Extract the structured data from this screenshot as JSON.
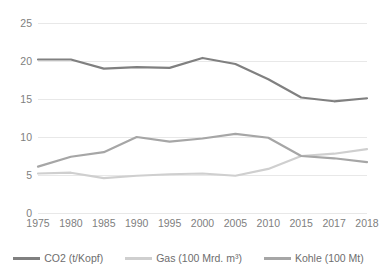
{
  "chart_data": {
    "type": "line",
    "title": "",
    "subtitle": "",
    "xlabel": "",
    "ylabel": "",
    "grid": true,
    "legend_position": "bottom",
    "ylim": [
      0,
      25
    ],
    "yticks": [
      0,
      5,
      10,
      15,
      20,
      25
    ],
    "categories": [
      "1975",
      "1980",
      "1985",
      "1990",
      "1995",
      "2000",
      "2005",
      "2010",
      "2015",
      "2017",
      "2018"
    ],
    "series": [
      {
        "name": "CO2 (t/Kopf)",
        "color": "#808080",
        "values": [
          20.2,
          20.2,
          19.0,
          19.2,
          19.1,
          20.4,
          19.6,
          17.6,
          15.2,
          14.7,
          15.1
        ]
      },
      {
        "name": "Gas (100 Mrd. m³)",
        "color": "#cfcfcf",
        "values": [
          5.2,
          5.3,
          4.6,
          4.9,
          5.1,
          5.2,
          4.9,
          5.8,
          7.5,
          7.8,
          8.4
        ]
      },
      {
        "name": "Kohle (100 Mt)",
        "color": "#a6a6a6",
        "values": [
          6.1,
          7.4,
          8.0,
          10.0,
          9.4,
          9.8,
          10.4,
          9.9,
          7.5,
          7.2,
          6.7
        ]
      }
    ]
  },
  "axes": {
    "y_tick_labels": [
      "25",
      "20",
      "15",
      "10",
      "5",
      "0"
    ],
    "x_tick_labels": [
      "1975",
      "1980",
      "1985",
      "1990",
      "1995",
      "2000",
      "2005",
      "2010",
      "2015",
      "2017",
      "2018"
    ]
  },
  "legend": {
    "items": [
      {
        "label": "CO2 (t/Kopf)",
        "color": "#808080"
      },
      {
        "label": "Gas (100 Mrd. m³)",
        "color": "#cfcfcf"
      },
      {
        "label": "Kohle (100 Mt)",
        "color": "#a6a6a6"
      }
    ]
  },
  "colors": {
    "background": "#ffffff",
    "gridline": "#e8e8e8",
    "axis_text": "#808080"
  }
}
